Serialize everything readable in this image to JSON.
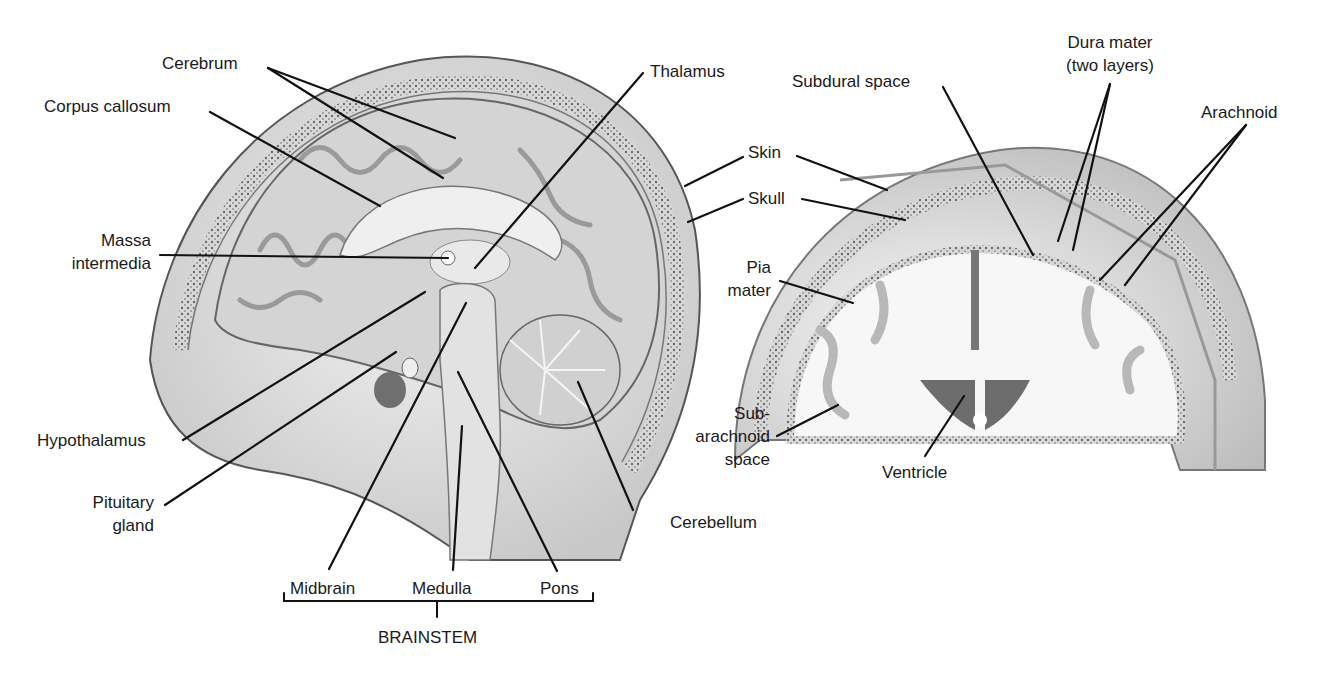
{
  "sagittal_view": {
    "labels": {
      "cerebrum": "Cerebrum",
      "corpus_callosum": "Corpus callosum",
      "massa_intermedia_1": "Massa",
      "massa_intermedia_2": "intermedia",
      "hypothalamus": "Hypothalamus",
      "pituitary_1": "Pituitary",
      "pituitary_2": "gland",
      "thalamus": "Thalamus",
      "skin": "Skin",
      "skull": "Skull",
      "cerebellum": "Cerebellum",
      "midbrain": "Midbrain",
      "medulla": "Medulla",
      "pons": "Pons",
      "brainstem": "BRAINSTEM"
    }
  },
  "coronal_view": {
    "labels": {
      "subdural_space": "Subdural space",
      "dura_mater_1": "Dura mater",
      "dura_mater_2": "(two layers)",
      "arachnoid": "Arachnoid",
      "pia_mater_1": "Pia",
      "pia_mater_2": "mater",
      "subarachnoid_1": "Sub-",
      "subarachnoid_2": "arachnoid",
      "subarachnoid_3": "space",
      "ventricle": "Ventricle"
    }
  },
  "colors": {
    "line": "#111111",
    "tissue_light": "#e6e6e6",
    "tissue_mid": "#bdbdbd",
    "tissue_dark": "#7a7a7a"
  }
}
